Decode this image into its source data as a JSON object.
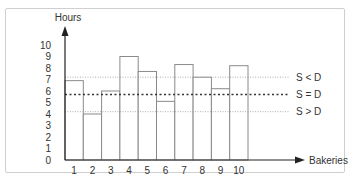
{
  "chart_data": {
    "type": "bar",
    "title": "",
    "xlabel": "Bakeries",
    "ylabel": "Hours",
    "ylim": [
      0,
      10
    ],
    "yticks": [
      0,
      1,
      2,
      3,
      4,
      5,
      6,
      7,
      8,
      9,
      10
    ],
    "categories": [
      "1",
      "2",
      "3",
      "4",
      "5",
      "6",
      "7",
      "8",
      "9",
      "10"
    ],
    "values": [
      6.9,
      4.0,
      6.0,
      9.0,
      7.7,
      5.1,
      8.3,
      7.2,
      6.2,
      8.2
    ],
    "reference_lines": [
      {
        "label": "S < D",
        "value": 7.2,
        "style": "thin-dotted"
      },
      {
        "label": "S = D",
        "value": 5.7,
        "style": "bold-dotted"
      },
      {
        "label": "S > D",
        "value": 4.2,
        "style": "thin-dotted"
      }
    ],
    "grid": false,
    "legend": "none"
  },
  "colors": {
    "axis": "#222222",
    "bar_stroke": "#8a8a8a",
    "bar_fill": "#ffffff",
    "ref_thin": "#9a9a9a",
    "ref_bold": "#333333",
    "frame": "#cfcfcf"
  }
}
